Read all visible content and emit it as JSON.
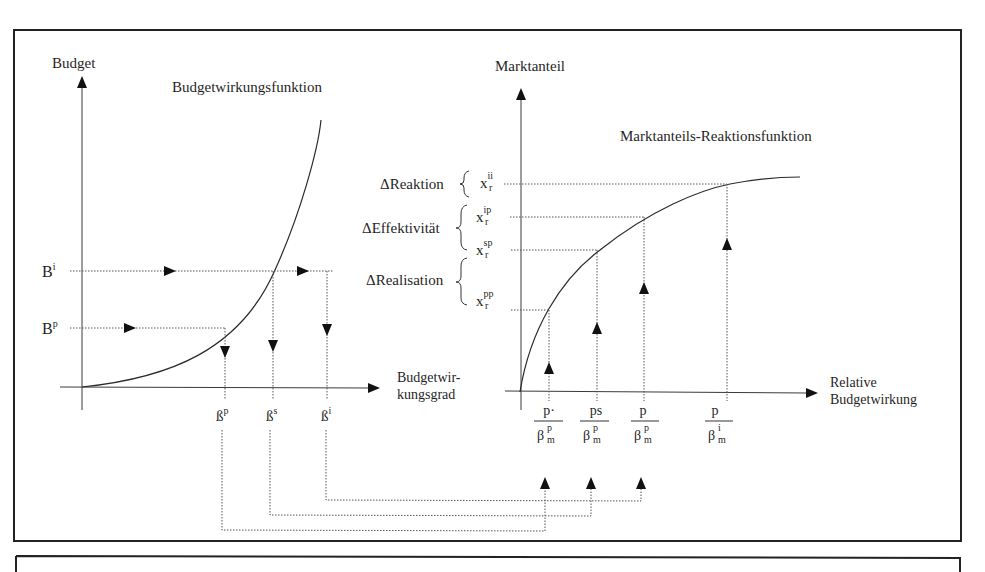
{
  "diagram": {
    "left_chart": {
      "title": "Budgetwirkungsfunktion",
      "y_axis_label": "Budget",
      "x_axis_label_line1": "Budgetwir-",
      "x_axis_label_line2": "kungsgrad",
      "y_ticks": [
        {
          "base": "B",
          "sup": "i"
        },
        {
          "base": "B",
          "sup": "p"
        }
      ],
      "x_ticks": [
        {
          "base": "ß",
          "sup": "p"
        },
        {
          "base": "ß",
          "sup": "s"
        },
        {
          "base": "ß",
          "sup": "i"
        }
      ]
    },
    "right_chart": {
      "title": "Marktanteils-Reaktionsfunktion",
      "y_axis_label": "Marktanteil",
      "x_axis_label_line1": "Relative",
      "x_axis_label_line2": "Budgetwirkung",
      "y_ticks": [
        {
          "base": "x",
          "sub": "r",
          "sup": "ii"
        },
        {
          "base": "x",
          "sub": "r",
          "sup": "ip"
        },
        {
          "base": "x",
          "sub": "r",
          "sup": "sp"
        },
        {
          "base": "x",
          "sub": "r",
          "sup": "pp"
        }
      ],
      "brace_labels": [
        "ΔReaktion",
        "ΔEffektivität",
        "ΔRealisation"
      ],
      "x_ticks": [
        {
          "num": "p·",
          "den_base": "β",
          "den_sub": "m",
          "den_sup": "p"
        },
        {
          "num": "ps",
          "den_base": "β",
          "den_sub": "m",
          "den_sup": "p"
        },
        {
          "num": "p",
          "den_base": "β",
          "den_sub": "m",
          "den_sup": "p"
        },
        {
          "num": "p",
          "den_base": "β",
          "den_sub": "m",
          "den_sup": "i"
        }
      ]
    }
  }
}
